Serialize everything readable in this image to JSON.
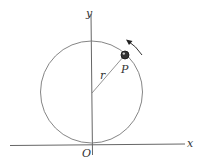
{
  "diagram": {
    "labels": {
      "y_axis": "y",
      "x_axis": "x",
      "origin": "O",
      "radius": "r",
      "particle": "P"
    },
    "colors": {
      "line": "#555555",
      "particle": "#222222",
      "text": "#333333"
    },
    "motion": "counter-clockwise"
  }
}
